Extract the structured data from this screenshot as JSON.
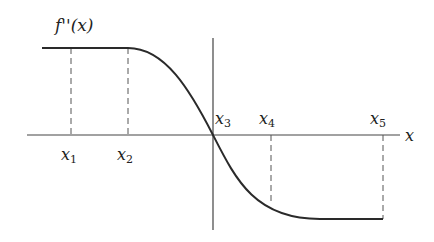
{
  "diagram": {
    "function_label": "f''(x)",
    "axis_label": "x",
    "points": [
      {
        "name": "x",
        "sub": "1"
      },
      {
        "name": "x",
        "sub": "2"
      },
      {
        "name": "x",
        "sub": "3"
      },
      {
        "name": "x",
        "sub": "4"
      },
      {
        "name": "x",
        "sub": "5"
      }
    ],
    "colors": {
      "curve": "#2a2a2a",
      "axis": "#444444",
      "dashed": "#555555"
    }
  }
}
